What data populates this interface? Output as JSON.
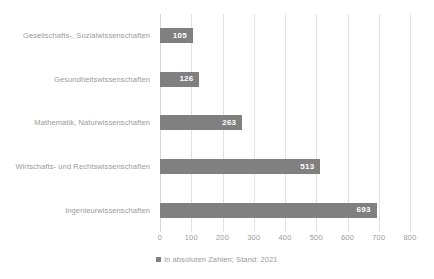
{
  "chart_data": {
    "type": "bar",
    "orientation": "horizontal",
    "title": "",
    "xlabel": "",
    "ylabel": "",
    "categories": [
      "Gesellschafts-, Sozialwissenschaften",
      "Gesundheitswissenschaften",
      "Mathematik, Naturwissenschaften",
      "Wirtschafts- und Rechtswissenschaften",
      "Ingenieurwissenschaften"
    ],
    "values": [
      105,
      126,
      263,
      513,
      693
    ],
    "value_labels": [
      "105",
      "126",
      "263",
      "513",
      "693"
    ],
    "xlim": [
      0,
      800
    ],
    "xticks": [
      0,
      100,
      200,
      300,
      400,
      500,
      600,
      700,
      800
    ],
    "xtick_labels": [
      "0",
      "100",
      "200",
      "300",
      "400",
      "500",
      "600",
      "700",
      "800"
    ],
    "grid": true,
    "grid_axis": "x",
    "legend_position": "bottom",
    "legend": [
      {
        "label": "in absoluten Zahlen; Stand: 2021",
        "color": "#808080"
      }
    ],
    "colors": {
      "bar": "#808080",
      "value_label": "#ffffff",
      "tick_label": "#9a9a9a",
      "category_label": "#9a9a9a",
      "gridline": "#e2e2e2",
      "background": "#ffffff"
    }
  }
}
